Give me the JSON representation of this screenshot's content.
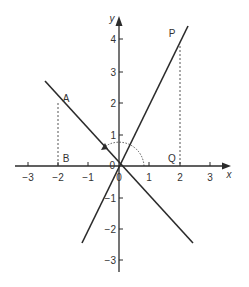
{
  "figure": {
    "type": "coordinate-plane",
    "origin_px": [
      119,
      166
    ],
    "unit_px": {
      "x": 30.5,
      "y": 31.5
    },
    "colors": {
      "line": "#2b2b2b",
      "dashed": "#555555",
      "text": "#333333",
      "background": "#ffffff"
    },
    "axes": {
      "x_label": "x",
      "y_label": "y",
      "x_ticks": [
        {
          "value": -3,
          "label": "−3"
        },
        {
          "value": -2,
          "label": "−2"
        },
        {
          "value": -1,
          "label": "−1"
        },
        {
          "value": 0,
          "label": "0"
        },
        {
          "value": 1,
          "label": "1"
        },
        {
          "value": 2,
          "label": "2"
        },
        {
          "value": 3,
          "label": "3"
        }
      ],
      "y_ticks": [
        {
          "value": 4,
          "label": "4"
        },
        {
          "value": 3,
          "label": "3"
        },
        {
          "value": 2,
          "label": "2"
        },
        {
          "value": 1,
          "label": "1"
        },
        {
          "value": -1,
          "label": "−1"
        },
        {
          "value": -2,
          "label": "−2"
        },
        {
          "value": -3,
          "label": "−3"
        }
      ],
      "origin_label_left": "0",
      "origin_label_below": "0"
    },
    "lines": [
      {
        "name": "line-through-P",
        "equation": "y = 2x",
        "from": [
          -1.2,
          -2.45
        ],
        "to": [
          2.27,
          4.4
        ]
      },
      {
        "name": "line-through-A",
        "equation": "y = -x",
        "from": [
          -2.4,
          2.4
        ],
        "to": [
          2.4,
          -2.4
        ]
      }
    ],
    "points": [
      {
        "label": "P",
        "coords": [
          2,
          4
        ]
      },
      {
        "label": "Q",
        "coords": [
          2,
          0
        ]
      },
      {
        "label": "A",
        "coords": [
          -2,
          2
        ]
      },
      {
        "label": "B",
        "coords": [
          -2,
          0
        ]
      }
    ],
    "dashed_segments": [
      {
        "name": "PQ",
        "from": [
          2,
          3.8
        ],
        "to": [
          2,
          0
        ]
      },
      {
        "name": "AB",
        "from": [
          -2,
          2
        ],
        "to": [
          -2,
          0
        ]
      }
    ],
    "rotation_arc": {
      "radius_units": 0.82,
      "start_deg": 0,
      "end_deg": 135,
      "direction": "counterclockwise"
    }
  },
  "labels": {
    "P": "P",
    "Q": "Q",
    "A": "A",
    "B": "B"
  }
}
